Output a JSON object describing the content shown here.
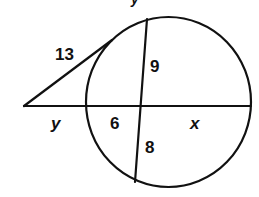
{
  "header": {
    "cut_off_text": "y"
  },
  "diagram": {
    "type": "circle-secant-tangent-chord",
    "colors": {
      "stroke": "#111111",
      "background": "#ffffff"
    },
    "labels": {
      "tangent_length": "13",
      "chord_upper_segment": "9",
      "chord_lower_segment": "8",
      "secant_external_segment": "y",
      "secant_inner_left_segment": "6",
      "secant_inner_right_segment": "x"
    }
  }
}
